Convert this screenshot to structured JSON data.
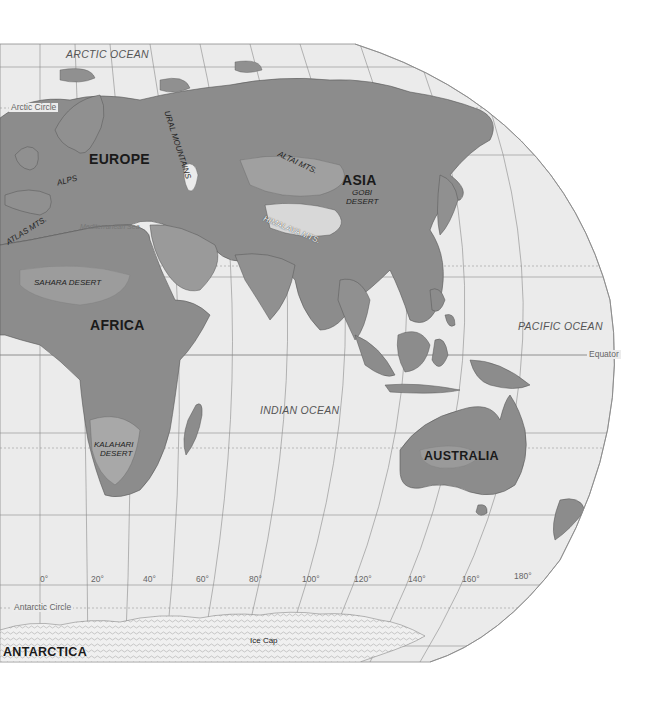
{
  "map": {
    "colors": {
      "background": "#ffffff",
      "ocean": "#ebebeb",
      "land": "#8c8c8c",
      "land_light": "#a8a8a8",
      "highland": "#6e6e6e",
      "ice": "#f2f2f2",
      "graticule": "#8a8a8a"
    },
    "continents": {
      "europe": "EUROPE",
      "asia": "ASIA",
      "africa": "AFRICA",
      "australia": "AUSTRALIA",
      "antarctica": "ANTARCTICA"
    },
    "oceans": {
      "arctic": "ARCTIC OCEAN",
      "indian": "INDIAN OCEAN",
      "pacific": "PACIFIC OCEAN",
      "mediterranean": "Mediterranean Sea"
    },
    "features": {
      "ural": "URAL MOUNTAINS",
      "alps": "ALPS",
      "altai": "ALTAI MTS.",
      "gobi_1": "GOBI",
      "gobi_2": "DESERT",
      "himalaya": "HIMALAYA MTS.",
      "atlas": "ATLAS MTS.",
      "sahara": "SAHARA  DESERT",
      "kalahari_1": "KALAHARI",
      "kalahari_2": "DESERT",
      "ice_cap": "Ice Cap"
    },
    "lines": {
      "arctic_circle": "Arctic Circle",
      "antarctic_circle": "Antarctic Circle",
      "equator": "Equator"
    },
    "longitudes": [
      "0°",
      "20°",
      "40°",
      "60°",
      "80°",
      "100°",
      "120°",
      "140°",
      "160°",
      "180°"
    ]
  }
}
